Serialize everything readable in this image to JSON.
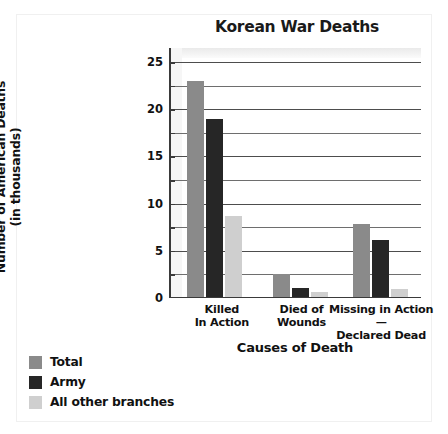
{
  "chart_data": {
    "type": "bar",
    "title": "Korean War Deaths",
    "xlabel": "Causes of Death",
    "ylabel": "Number of American Deaths (in thousands)",
    "ylabel_line1": "Number of American Deaths",
    "ylabel_line2": "(in thousands)",
    "categories": [
      "Killed In Action",
      "Died of Wounds",
      "Missing in Action—Declared Dead"
    ],
    "category_lines": [
      [
        "Killed",
        "In Action"
      ],
      [
        "Died of",
        "Wounds"
      ],
      [
        "Missing in Action—",
        "Declared Dead"
      ]
    ],
    "series": [
      {
        "name": "Total",
        "color": "#8a8a8a",
        "values": [
          23.0,
          2.5,
          7.8
        ]
      },
      {
        "name": "Army",
        "color": "#262626",
        "values": [
          19.0,
          1.1,
          6.2
        ]
      },
      {
        "name": "All other branches",
        "color": "#cfcfcf",
        "values": [
          8.7,
          0.6,
          1.0
        ]
      }
    ],
    "ylim": [
      0,
      26.5
    ],
    "ytick_labels": [
      "0",
      "5",
      "10",
      "15",
      "20",
      "25"
    ],
    "ytick_values": [
      0,
      5,
      10,
      15,
      20,
      25
    ],
    "gridline_values": [
      2.5,
      5,
      7.5,
      10,
      12.5,
      15,
      17.5,
      20,
      22.5,
      25
    ],
    "grid": true,
    "legend_position": "below-left",
    "units": "thousands"
  },
  "legend": {
    "items": [
      {
        "label": "Total",
        "color": "#8a8a8a"
      },
      {
        "label": "Army",
        "color": "#262626"
      },
      {
        "label": "All other branches",
        "color": "#cfcfcf"
      }
    ]
  }
}
